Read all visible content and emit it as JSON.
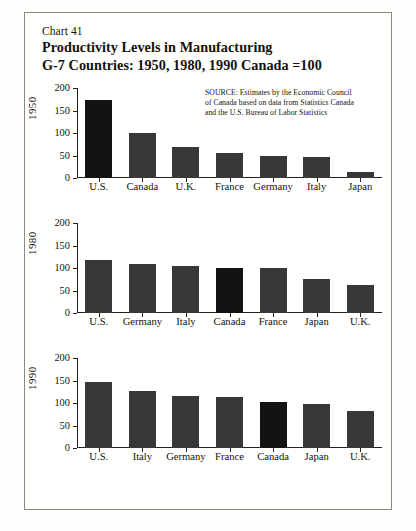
{
  "chart_number": "Chart 41",
  "title_line_1": "Productivity Levels in Manufacturing",
  "title_line_2": "G-7 Countries: 1950, 1980, 1990  Canada =100",
  "source": {
    "line_1": "SOURCE:  Estimates by the Economic Council",
    "line_2": "of Canada based on data from Statistics Canada",
    "line_3": "and the U.S. Bureau of Labor Statistics"
  },
  "axis": {
    "ticks": [
      "200",
      "150",
      "100",
      "50",
      "0"
    ],
    "tick_values": [
      200,
      150,
      100,
      50,
      0
    ],
    "ymin": 0,
    "ymax": 200
  },
  "panels": [
    {
      "era": "1950",
      "categories": [
        "U.S.",
        "Canada",
        "U.K.",
        "France",
        "Germany",
        "Italy",
        "Japan"
      ],
      "values": [
        173,
        100,
        69,
        55,
        50,
        46,
        14
      ],
      "accent_index": 0
    },
    {
      "era": "1980",
      "categories": [
        "U.S.",
        "Germany",
        "Italy",
        "Canada",
        "France",
        "Japan",
        "U.K."
      ],
      "values": [
        118,
        109,
        105,
        100,
        101,
        76,
        62
      ],
      "accent_index": 3
    },
    {
      "era": "1990",
      "categories": [
        "U.S.",
        "Italy",
        "Germany",
        "France",
        "Canada",
        "Japan",
        "U.K."
      ],
      "values": [
        146,
        126,
        116,
        113,
        102,
        97,
        83
      ],
      "accent_index": 4
    }
  ],
  "colors": {
    "bar": "#3a3836",
    "bar_accent": "#141312",
    "axis": "#22211e",
    "frame": "#8a8a84",
    "text": "#14120f",
    "background": "#fffffd"
  },
  "chart_data": {
    "type": "bar",
    "title": "Productivity Levels in Manufacturing",
    "subtitle": "G-7 Countries: 1950, 1980, 1990  Canada =100",
    "xlabel": "",
    "ylabel": "",
    "ylim": [
      0,
      200
    ],
    "yticks": [
      0,
      50,
      100,
      150,
      200
    ],
    "grid": false,
    "legend": "none",
    "note": "Index, Canada = 100. Three stacked panels, one per year; bars sorted descending within each panel.",
    "panels": [
      {
        "name": "1950",
        "categories": [
          "U.S.",
          "Canada",
          "U.K.",
          "France",
          "Germany",
          "Italy",
          "Japan"
        ],
        "values": [
          173,
          100,
          69,
          55,
          50,
          46,
          14
        ]
      },
      {
        "name": "1980",
        "categories": [
          "U.S.",
          "Germany",
          "Italy",
          "Canada",
          "France",
          "Japan",
          "U.K."
        ],
        "values": [
          118,
          109,
          105,
          100,
          101,
          76,
          62
        ]
      },
      {
        "name": "1990",
        "categories": [
          "U.S.",
          "Italy",
          "Germany",
          "France",
          "Canada",
          "Japan",
          "U.K."
        ],
        "values": [
          146,
          126,
          116,
          113,
          102,
          97,
          83
        ]
      }
    ]
  }
}
